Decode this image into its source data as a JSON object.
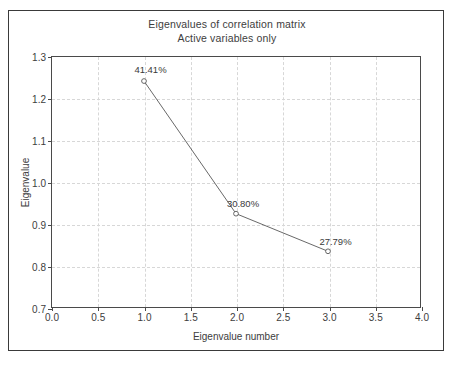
{
  "chart_data": {
    "type": "line",
    "title": "Eigenvalues of correlation matrix",
    "subtitle": "Active variables only",
    "xlabel": "Eigenvalue number",
    "ylabel": "Eigenvalue",
    "xlim": [
      0.0,
      4.0
    ],
    "ylim": [
      0.7,
      1.3
    ],
    "grid": true,
    "legend": "none",
    "marker": "open-circle",
    "line_color": "#555555",
    "x": [
      1.0,
      2.0,
      3.0
    ],
    "values": [
      1.2423,
      0.924,
      0.8337
    ],
    "point_labels": [
      "41.41%",
      "30.80%",
      "27.79%"
    ],
    "xticks": [
      "0.0",
      "0.5",
      "1.0",
      "1.5",
      "2.0",
      "2.5",
      "3.0",
      "3.5",
      "4.0"
    ],
    "xtick_values": [
      0.0,
      0.5,
      1.0,
      1.5,
      2.0,
      2.5,
      3.0,
      3.5,
      4.0
    ],
    "yticks": [
      "0.7",
      "0.8",
      "0.9",
      "1.0",
      "1.1",
      "1.2",
      "1.3"
    ],
    "ytick_values": [
      0.7,
      0.8,
      0.9,
      1.0,
      1.1,
      1.2,
      1.3
    ]
  }
}
